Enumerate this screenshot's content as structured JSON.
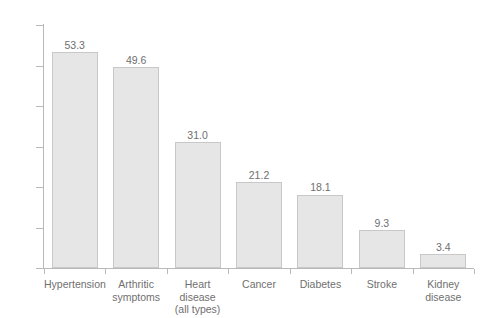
{
  "chart_data": {
    "type": "bar",
    "title": "",
    "subtitle": "",
    "xlabel": "",
    "ylabel": "",
    "ylim": [
      0,
      60
    ],
    "yticks": [
      0,
      10,
      20,
      30,
      40,
      50,
      60
    ],
    "grid": false,
    "legend": null,
    "categories": [
      "Hypertension",
      "Arthritic symptoms",
      "Heart disease (all types)",
      "Cancer",
      "Diabetes",
      "Stroke",
      "Kidney disease"
    ],
    "category_lines": [
      [
        "Hypertension"
      ],
      [
        "Arthritic",
        "symptoms"
      ],
      [
        "Heart disease",
        "(all types)"
      ],
      [
        "Cancer"
      ],
      [
        "Diabetes"
      ],
      [
        "Stroke"
      ],
      [
        "Kidney",
        "disease"
      ]
    ],
    "values": [
      53.3,
      49.6,
      31.0,
      21.2,
      18.1,
      9.3,
      3.4
    ],
    "value_labels": [
      "53.3",
      "49.6",
      "31.0",
      "21.2",
      "18.1",
      "9.3",
      "3.4"
    ],
    "ytick_labels": [
      "0",
      "10",
      "20",
      "30",
      "40",
      "50",
      "60"
    ],
    "colors": {
      "bar_fill": "#e6e6e6",
      "bar_edge": "#c8c8c8",
      "axis": "#b9b9b9",
      "text": "#6f6f6f",
      "background": "#ffffff"
    }
  }
}
